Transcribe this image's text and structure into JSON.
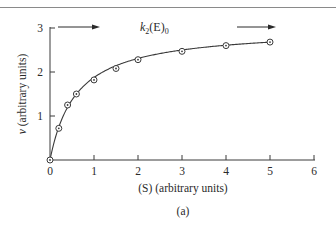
{
  "chart_data": {
    "type": "scatter",
    "title": "",
    "caption": "(a)",
    "xlabel": "(S) (arbitrary units)",
    "ylabel": "v (arbitrary units)",
    "xlim": [
      0,
      6
    ],
    "ylim": [
      0,
      3
    ],
    "x_ticks": [
      "0",
      "1",
      "2",
      "3",
      "4",
      "5",
      "6"
    ],
    "y_ticks": [
      "1",
      "2",
      "3"
    ],
    "grid": false,
    "annotation": {
      "text_k": "k",
      "text_sub": "2",
      "text_rest": "(E)",
      "text_sub2": "0",
      "full": "k2(E)0",
      "meaning": "asymptote / maximum velocity"
    },
    "series": [
      {
        "name": "v vs (S)",
        "marker": "circle-dot",
        "line": "smooth fitted curve",
        "x": [
          0,
          0.2,
          0.4,
          0.6,
          1.0,
          1.5,
          2.0,
          3.0,
          4.0,
          5.0
        ],
        "y": [
          0,
          0.72,
          1.25,
          1.5,
          1.82,
          2.08,
          2.28,
          2.47,
          2.6,
          2.68
        ]
      }
    ]
  }
}
